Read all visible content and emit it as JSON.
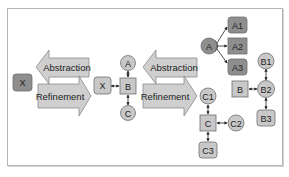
{
  "diagram": {
    "colors": {
      "frame": "#b5b5b5",
      "node_light": "#c8c8c8",
      "node_dark": "#8e8e8e",
      "node_stroke": "#6e6e6e",
      "arrow_fill": "#cfcfcf",
      "edge": "#222222"
    },
    "left_panel": {
      "single_node": {
        "label": "X",
        "shape": "rounded-rect",
        "tone": "dark"
      },
      "abstraction_label": "Abstraction",
      "refinement_label": "Refinement"
    },
    "middle_panel": {
      "nodes": [
        {
          "id": "x",
          "label": "X",
          "shape": "rounded-rect",
          "tone": "light"
        },
        {
          "id": "b",
          "label": "B",
          "shape": "square",
          "tone": "light"
        },
        {
          "id": "a",
          "label": "A",
          "shape": "circle",
          "tone": "light"
        },
        {
          "id": "c",
          "label": "C",
          "shape": "circle",
          "tone": "light"
        }
      ],
      "edges": [
        [
          "x",
          "b"
        ],
        [
          "b",
          "a"
        ],
        [
          "b",
          "c"
        ]
      ],
      "abstraction_label": "Abstraction",
      "refinement_label": "Refinement"
    },
    "right_panel": {
      "a_cluster": {
        "root": {
          "label": "A",
          "shape": "circle",
          "tone": "dark"
        },
        "children": [
          {
            "label": "A1",
            "shape": "rounded-rect",
            "tone": "dark"
          },
          {
            "label": "A2",
            "shape": "square",
            "tone": "dark"
          },
          {
            "label": "A3",
            "shape": "rounded-rect",
            "tone": "dark"
          }
        ]
      },
      "b_cluster": {
        "nodes": [
          {
            "id": "b",
            "label": "B",
            "shape": "square",
            "tone": "light"
          },
          {
            "id": "b1",
            "label": "B1",
            "shape": "circle",
            "tone": "light"
          },
          {
            "id": "b2",
            "label": "B2",
            "shape": "circle",
            "tone": "light"
          },
          {
            "id": "b3",
            "label": "B3",
            "shape": "rounded-rect",
            "tone": "light"
          }
        ],
        "edges": [
          [
            "b",
            "b2"
          ],
          [
            "b2",
            "b1"
          ],
          [
            "b2",
            "b3"
          ]
        ]
      },
      "c_cluster": {
        "nodes": [
          {
            "id": "c",
            "label": "C",
            "shape": "square",
            "tone": "light"
          },
          {
            "id": "c1",
            "label": "C1",
            "shape": "circle",
            "tone": "light"
          },
          {
            "id": "c2",
            "label": "C2",
            "shape": "circle",
            "tone": "light"
          },
          {
            "id": "c3",
            "label": "C3",
            "shape": "rounded-rect",
            "tone": "light"
          }
        ],
        "edges": [
          [
            "c",
            "c1"
          ],
          [
            "c",
            "c2"
          ],
          [
            "c",
            "c3"
          ]
        ]
      }
    }
  }
}
